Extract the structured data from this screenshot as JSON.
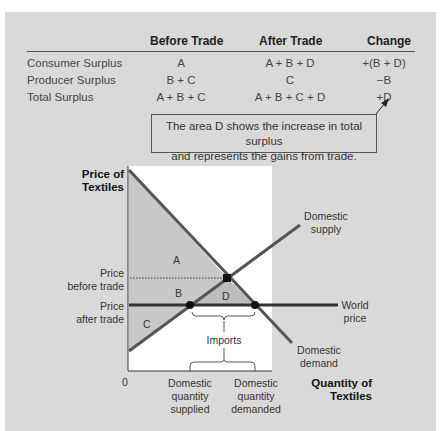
{
  "table": {
    "headers": [
      "",
      "Before Trade",
      "After Trade",
      "Change"
    ],
    "rows": [
      {
        "label": "Consumer Surplus",
        "before": "A",
        "after": "A + B + D",
        "change": "+(B + D)"
      },
      {
        "label": "Producer Surplus",
        "before": "B + C",
        "after": "C",
        "change": "−B"
      },
      {
        "label": "Total Surplus",
        "before": "A + B + C",
        "after": "A + B + C + D",
        "change": "+D"
      }
    ]
  },
  "callout": {
    "line1": "The area D shows the increase in total surplus",
    "line2": "and represents the gains from trade."
  },
  "graph": {
    "y_axis_title_1": "Price of",
    "y_axis_title_2": "Textiles",
    "x_axis_title_1": "Quantity of",
    "x_axis_title_2": "Textiles",
    "origin": "0",
    "price_before_1": "Price",
    "price_before_2": "before trade",
    "price_after_1": "Price",
    "price_after_2": "after trade",
    "area_a": "A",
    "area_b": "B",
    "area_c": "C",
    "area_d": "D",
    "supply_1": "Domestic",
    "supply_2": "supply",
    "demand_1": "Domestic",
    "demand_2": "demand",
    "world_1": "World",
    "world_2": "price",
    "imports": "Imports",
    "qs_1": "Domestic",
    "qs_2": "quantity",
    "qs_3": "supplied",
    "qd_1": "Domestic",
    "qd_2": "quantity",
    "qd_3": "demanded"
  },
  "colors": {
    "panel": "#d9d9d9",
    "plot": "#ffffff",
    "shade": "#c8c8c8",
    "shade_d": "#bdbdbd",
    "curve": "#555555",
    "world_price": "#333333"
  }
}
